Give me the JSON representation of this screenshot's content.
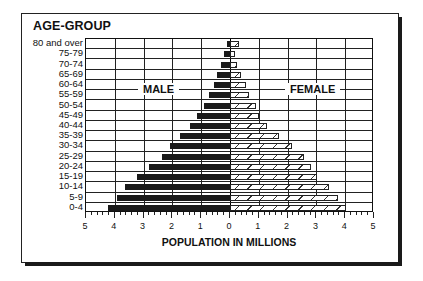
{
  "chart_data": {
    "type": "bar",
    "subtype": "population-pyramid",
    "title": "AGE-GROUP",
    "xlabel": "POPULATION IN MILLIONS",
    "ylabel": "AGE-GROUP",
    "xlim": [
      -5,
      5
    ],
    "x_ticks": [
      "5",
      "4",
      "3",
      "2",
      "1",
      "0",
      "1",
      "2",
      "3",
      "4",
      "5"
    ],
    "grid": true,
    "legend": [
      "MALE",
      "FEMALE"
    ],
    "categories": [
      "80 and over",
      "75-79",
      "70-74",
      "65-69",
      "60-64",
      "55-59",
      "50-54",
      "45-49",
      "40-44",
      "35-39",
      "30-34",
      "25-29",
      "20-24",
      "15-19",
      "10-14",
      "5-9",
      "0-4"
    ],
    "series": [
      {
        "name": "MALE",
        "color": "#1a1a1a",
        "values": [
          0.1,
          0.2,
          0.3,
          0.45,
          0.57,
          0.72,
          0.89,
          1.13,
          1.38,
          1.72,
          2.09,
          2.37,
          2.82,
          3.24,
          3.66,
          3.94,
          4.25
        ]
      },
      {
        "name": "FEMALE",
        "color": "hatched",
        "values": [
          0.3,
          0.17,
          0.26,
          0.38,
          0.56,
          0.67,
          0.92,
          1.02,
          1.27,
          1.69,
          2.14,
          2.57,
          2.81,
          3.02,
          3.45,
          3.75,
          4.03
        ]
      }
    ]
  },
  "labels": {
    "title": "AGE-GROUP",
    "male": "MALE",
    "female": "FEMALE",
    "xlabel": "POPULATION IN MILLIONS"
  }
}
